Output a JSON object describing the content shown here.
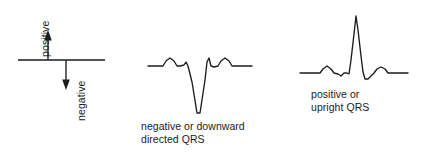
{
  "figure": {
    "background_color": "#ffffff",
    "ink_color": "#1b1b1b"
  },
  "panels": {
    "axis_reference": {
      "name": "polarity-axis",
      "baseline_label": "",
      "up_arrow_label": "positive",
      "down_arrow_label": "negative",
      "geometry": {
        "baseline_y": 60,
        "baseline_x_start": 18,
        "baseline_x_end": 105,
        "up_arrow_x": 48,
        "up_arrow_tip_y": 31,
        "down_arrow_x": 66,
        "down_arrow_tip_y": 89
      }
    },
    "negative_qrs": {
      "name": "negative-qrs-waveform",
      "caption_line_1": "negative or downward",
      "caption_line_2": "directed QRS",
      "baseline_y": 66,
      "description": "P wave, deep downward Q/S deflection, T wave"
    },
    "positive_qrs": {
      "name": "positive-qrs-waveform",
      "caption_line_1": "positive or",
      "caption_line_2": "upright QRS",
      "baseline_y": 73,
      "description": "P wave, tall upright R wave, T wave"
    }
  },
  "chart_data": {
    "type": "line",
    "xlabel": "",
    "ylabel": "",
    "grid": false,
    "legend": "none",
    "series": [
      {
        "name": "negative or downward directed QRS",
        "baseline": 66,
        "points": [
          [
            148,
            66
          ],
          [
            160,
            66
          ],
          [
            163,
            66
          ],
          [
            166,
            61
          ],
          [
            170,
            58
          ],
          [
            174,
            61
          ],
          [
            177,
            66
          ],
          [
            180,
            66
          ],
          [
            184,
            65
          ],
          [
            186,
            62
          ],
          [
            188,
            66
          ],
          [
            192,
            82
          ],
          [
            197,
            113
          ],
          [
            200,
            113
          ],
          [
            205,
            80
          ],
          [
            207,
            62
          ],
          [
            209,
            58
          ],
          [
            211,
            66
          ],
          [
            214,
            67
          ],
          [
            218,
            66
          ],
          [
            221,
            61
          ],
          [
            225,
            58
          ],
          [
            229,
            61
          ],
          [
            232,
            66
          ],
          [
            240,
            66
          ],
          [
            252,
            66
          ]
        ]
      },
      {
        "name": "positive or upright QRS",
        "baseline": 73,
        "points": [
          [
            300,
            73
          ],
          [
            316,
            73
          ],
          [
            320,
            73
          ],
          [
            323,
            69
          ],
          [
            327,
            66
          ],
          [
            331,
            69
          ],
          [
            334,
            73
          ],
          [
            338,
            74
          ],
          [
            341,
            76
          ],
          [
            344,
            73
          ],
          [
            347,
            73
          ],
          [
            349,
            74
          ],
          [
            351,
            60
          ],
          [
            354,
            34
          ],
          [
            356,
            16
          ],
          [
            358,
            30
          ],
          [
            361,
            56
          ],
          [
            363,
            72
          ],
          [
            365,
            79
          ],
          [
            368,
            79
          ],
          [
            371,
            76
          ],
          [
            374,
            73
          ],
          [
            377,
            69
          ],
          [
            381,
            67
          ],
          [
            385,
            69
          ],
          [
            388,
            73
          ],
          [
            396,
            73
          ],
          [
            408,
            73
          ]
        ]
      }
    ]
  }
}
